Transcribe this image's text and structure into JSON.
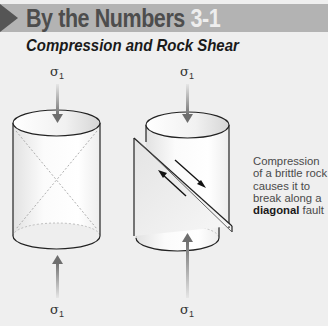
{
  "header": {
    "title": "By the Numbers",
    "number": "3-1",
    "arrow_icon": "play-triangle-icon",
    "bar_color": "#b3b3b3"
  },
  "subtitle": "Compression and Rock Shear",
  "labels": {
    "left_top_sigma": "σ",
    "left_bottom_sigma": "σ",
    "right_top_sigma": "σ",
    "right_bottom_sigma": "σ",
    "sigma_subscript": "1"
  },
  "diagram": {
    "left_cylinder": {
      "description": "intact rock cylinder with dashed X-shaped potential shear planes"
    },
    "right_cylinder": {
      "description": "rock cylinder displaced along a diagonal fault plane with opposing shear arrows"
    },
    "arrow_color": "#7a7a7a"
  },
  "caption": {
    "line1": "Compression",
    "line2": "of a brittle rock",
    "line3": "causes it to",
    "line4": "break along a",
    "bold_word": "diagonal",
    "line5_rest": " fault"
  }
}
